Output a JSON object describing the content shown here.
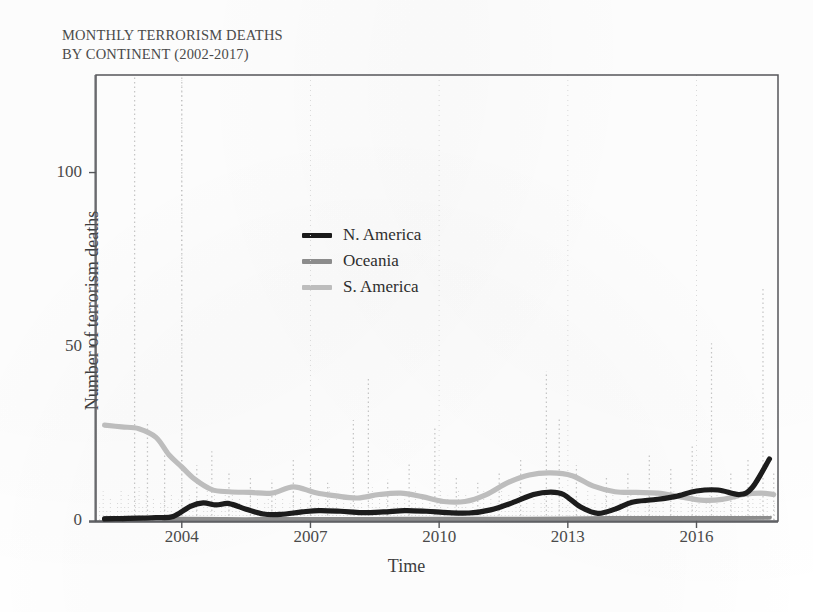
{
  "chart_data": {
    "type": "line",
    "title": "MONTHLY TERRORISM DEATHS\nBY CONTINENT (2002-2017)",
    "title_line1": "MONTHLY TERRORISM DEATHS",
    "title_line2": "BY CONTINENT (2002-2017)",
    "xlabel": "Time",
    "ylabel": "Number of terrorism deaths",
    "xlim": [
      2002.0,
      2017.9
    ],
    "ylim": [
      0,
      128
    ],
    "yticks": [
      0,
      50,
      100
    ],
    "ytick_labels": [
      "0",
      "50",
      "100"
    ],
    "xticks": [
      2004,
      2007,
      2010,
      2013,
      2016
    ],
    "xtick_labels": [
      "2004",
      "2007",
      "2010",
      "2013",
      "2016"
    ],
    "grid": "faint vertical dotted gridlines at x ticks",
    "legend_position": "upper-center-left inside plot",
    "legend": [
      {
        "name": "N. America",
        "color": "#1a1a1a"
      },
      {
        "name": "Oceania",
        "color": "#8c8c8c"
      },
      {
        "name": "S. America",
        "color": "#bdbdbd"
      }
    ],
    "series": [
      {
        "name": "N. America",
        "color": "#1a1a1a",
        "style": "smoothed trend, thick",
        "x": [
          2002.2,
          2002.6,
          2003.0,
          2003.4,
          2003.8,
          2004.2,
          2004.5,
          2004.8,
          2005.1,
          2005.5,
          2005.9,
          2006.3,
          2006.8,
          2007.2,
          2007.7,
          2008.2,
          2008.7,
          2009.2,
          2009.7,
          2010.2,
          2010.7,
          2011.2,
          2011.7,
          2012.2,
          2012.6,
          2012.9,
          2013.3,
          2013.7,
          2014.1,
          2014.5,
          2015.0,
          2015.5,
          2016.0,
          2016.5,
          2017.0,
          2017.3,
          2017.7
        ],
        "values": [
          0.6,
          0.7,
          0.8,
          1.0,
          1.3,
          4.2,
          5.2,
          4.6,
          5.0,
          3.4,
          2.0,
          1.9,
          2.6,
          3.0,
          2.8,
          2.4,
          2.6,
          3.0,
          2.8,
          2.4,
          2.3,
          3.2,
          5.2,
          7.6,
          8.3,
          7.6,
          4.0,
          2.2,
          3.4,
          5.4,
          6.1,
          7.0,
          8.6,
          8.9,
          7.6,
          9.6,
          17.8
        ]
      },
      {
        "name": "Oceania",
        "color": "#8c8c8c",
        "style": "smoothed trend, thick, near zero",
        "x": [
          2002.2,
          2003.0,
          2004.0,
          2005.0,
          2006.0,
          2007.0,
          2008.0,
          2009.0,
          2010.0,
          2011.0,
          2012.0,
          2013.0,
          2014.0,
          2015.0,
          2016.0,
          2017.0,
          2017.7
        ],
        "values": [
          0.7,
          0.6,
          0.5,
          0.4,
          0.4,
          0.4,
          0.4,
          0.5,
          0.5,
          0.5,
          0.5,
          0.6,
          0.7,
          0.8,
          0.9,
          1.0,
          1.1
        ]
      },
      {
        "name": "S. America",
        "color": "#bdbdbd",
        "style": "smoothed trend, thick",
        "x": [
          2002.2,
          2002.6,
          2003.0,
          2003.4,
          2003.7,
          2004.0,
          2004.3,
          2004.7,
          2005.1,
          2005.6,
          2006.1,
          2006.6,
          2007.1,
          2007.6,
          2008.1,
          2008.6,
          2009.1,
          2009.6,
          2010.1,
          2010.6,
          2011.1,
          2011.6,
          2012.1,
          2012.6,
          2013.1,
          2013.6,
          2014.1,
          2014.6,
          2015.1,
          2015.6,
          2016.1,
          2016.6,
          2017.1,
          2017.5,
          2017.8
        ],
        "values": [
          27.5,
          27.0,
          26.5,
          24.0,
          19.0,
          15.5,
          12.0,
          9.0,
          8.4,
          8.2,
          8.0,
          9.8,
          8.2,
          7.2,
          6.6,
          7.6,
          8.0,
          7.0,
          5.6,
          5.6,
          7.6,
          11.0,
          13.2,
          13.8,
          13.0,
          10.0,
          8.4,
          8.2,
          8.0,
          7.0,
          6.0,
          6.2,
          7.6,
          8.0,
          7.6
        ]
      },
      {
        "name": "raw monthly spikes",
        "color": "#9a9a9a",
        "style": "faint dotted vertical spikes (underlying monthly data)",
        "spikes": [
          {
            "x": 2002.9,
            "value": 128
          },
          {
            "x": 2003.2,
            "value": 28
          },
          {
            "x": 2003.6,
            "value": 22
          },
          {
            "x": 2004.0,
            "value": 128
          },
          {
            "x": 2004.35,
            "value": 16
          },
          {
            "x": 2004.7,
            "value": 20
          },
          {
            "x": 2005.1,
            "value": 14
          },
          {
            "x": 2005.6,
            "value": 13
          },
          {
            "x": 2006.1,
            "value": 12
          },
          {
            "x": 2006.6,
            "value": 18
          },
          {
            "x": 2007.0,
            "value": 14
          },
          {
            "x": 2007.4,
            "value": 11
          },
          {
            "x": 2008.0,
            "value": 29
          },
          {
            "x": 2008.35,
            "value": 41
          },
          {
            "x": 2008.8,
            "value": 12
          },
          {
            "x": 2009.3,
            "value": 17
          },
          {
            "x": 2009.9,
            "value": 27
          },
          {
            "x": 2010.4,
            "value": 13
          },
          {
            "x": 2010.9,
            "value": 11
          },
          {
            "x": 2011.4,
            "value": 14
          },
          {
            "x": 2011.9,
            "value": 18
          },
          {
            "x": 2012.5,
            "value": 43
          },
          {
            "x": 2012.8,
            "value": 30
          },
          {
            "x": 2013.2,
            "value": 16
          },
          {
            "x": 2013.9,
            "value": 13
          },
          {
            "x": 2014.4,
            "value": 14
          },
          {
            "x": 2014.9,
            "value": 19
          },
          {
            "x": 2015.4,
            "value": 15
          },
          {
            "x": 2015.9,
            "value": 22
          },
          {
            "x": 2016.35,
            "value": 51
          },
          {
            "x": 2016.8,
            "value": 14
          },
          {
            "x": 2017.2,
            "value": 18
          },
          {
            "x": 2017.55,
            "value": 67
          },
          {
            "x": 2017.8,
            "value": 14
          }
        ]
      }
    ]
  }
}
